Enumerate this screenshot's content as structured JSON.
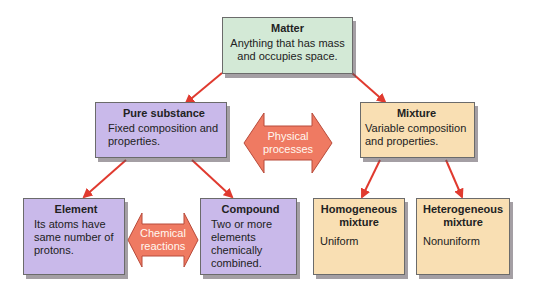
{
  "diagram": {
    "colors": {
      "matter_fill": "#d3e9d6",
      "pure_fill": "#c9b9ea",
      "mixture_fill": "#f9dfb3",
      "arrow_red": "#e03a2f",
      "double_arrow_fill": "#ef7a62"
    },
    "nodes": {
      "matter": {
        "title": "Matter",
        "desc": "Anything that has mass and occupies space."
      },
      "pure_substance": {
        "title": "Pure substance",
        "desc": "Fixed composition and properties."
      },
      "mixture": {
        "title": "Mixture",
        "desc": "Variable composition and properties."
      },
      "element": {
        "title": "Element",
        "desc": "Its atoms have same number of protons."
      },
      "compound": {
        "title": "Compound",
        "desc": "Two or more elements chemically combined."
      },
      "homogeneous": {
        "title": "Homogeneous mixture",
        "desc": "Uniform"
      },
      "heterogeneous": {
        "title": "Heterogeneous mixture",
        "desc": "Nonuniform"
      }
    },
    "connectors": {
      "physical": {
        "label": "Physical processes"
      },
      "chemical": {
        "label": "Chemical reactions"
      }
    },
    "edges": [
      {
        "from": "matter",
        "to": "pure_substance"
      },
      {
        "from": "matter",
        "to": "mixture"
      },
      {
        "from": "pure_substance",
        "to": "element"
      },
      {
        "from": "pure_substance",
        "to": "compound"
      },
      {
        "from": "mixture",
        "to": "homogeneous"
      },
      {
        "from": "mixture",
        "to": "heterogeneous"
      }
    ]
  }
}
